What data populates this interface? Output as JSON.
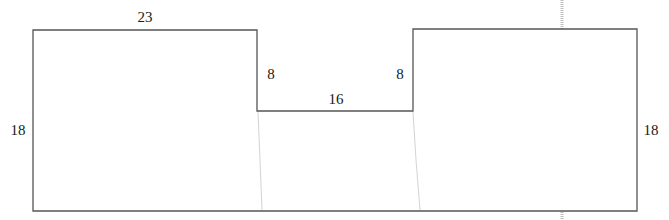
{
  "diagram": {
    "type": "composite-shape-dimensions",
    "colors": {
      "outline": "#555555",
      "text": "#1a1a1a",
      "fold": "#c8c8c8",
      "tick": "#bdbdbd"
    },
    "labels": {
      "left_top_width": "23",
      "left_height": "18",
      "right_height": "18",
      "notch_left_depth": "8",
      "notch_right_depth": "8",
      "notch_width": "16"
    }
  }
}
